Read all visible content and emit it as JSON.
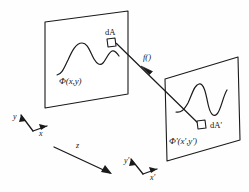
{
  "figure": {
    "background_color": "#fefefe",
    "stroke_color": "#1a1a1a",
    "planes": [
      {
        "id": "object-plane",
        "field_label": "Φ(x,y)",
        "element_label": "dA",
        "description": "left parallelogram plane carrying waveform and differential area element dA"
      },
      {
        "id": "image-plane",
        "field_label": "Φ'(x',y')",
        "element_label": "dA'",
        "description": "right parallelogram plane carrying waveform and differential area element dA'"
      }
    ],
    "ray": {
      "label": "f()",
      "from": "dA",
      "to": "dA'",
      "arrow_direction": "toward-left-plane"
    },
    "axes": [
      {
        "id": "object-axes",
        "labels": [
          "y",
          "x"
        ]
      },
      {
        "id": "propagation",
        "labels": [
          "z"
        ]
      },
      {
        "id": "image-axes",
        "labels": [
          "y'",
          "x'"
        ]
      }
    ],
    "labels": {
      "phi": "Φ(x,y)",
      "phi_prime": "Φ'(x',y')",
      "dA": "dA",
      "dA_prime": "dA'",
      "f": "f()",
      "z": "z",
      "y": "y",
      "x": "x",
      "y_prime": "y'",
      "x_prime": "x'"
    }
  }
}
